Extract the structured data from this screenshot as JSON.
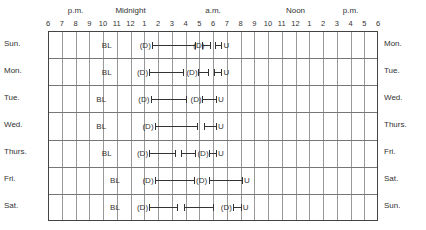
{
  "chart_data": {
    "type": "table",
    "title": "",
    "x_axis": {
      "period_labels": [
        {
          "label": "p.m.",
          "hour": 2
        },
        {
          "label": "Midnight",
          "hour": 6
        },
        {
          "label": "a.m.",
          "hour": 12
        },
        {
          "label": "Noon",
          "hour": 18
        },
        {
          "label": "p.m.",
          "hour": 22
        }
      ],
      "ticks": [
        "6",
        "7",
        "8",
        "9",
        "10",
        "11",
        "12",
        "1",
        "2",
        "3",
        "4",
        "5",
        "6",
        "7",
        "8",
        "9",
        "10",
        "11",
        "12",
        "1",
        "2",
        "3",
        "4",
        "5",
        "6"
      ],
      "range_hours_after_6pm": [
        0,
        24
      ]
    },
    "rows": [
      {
        "day_start": "Sun.",
        "day_end": "Mon.",
        "BL": 4.2,
        "D_marks": [
          7.0,
          10.9
        ],
        "sleep_segments": [
          [
            7.5,
            10.7
          ],
          [
            11.1,
            11.8
          ],
          [
            12.1,
            12.6
          ]
        ],
        "U": 12.9
      },
      {
        "day_start": "Mon.",
        "day_end": "Tue.",
        "BL": 4.2,
        "D_marks": [
          6.8,
          10.4
        ],
        "sleep_segments": [
          [
            7.3,
            9.8
          ],
          [
            10.8,
            11.6
          ],
          [
            12.0,
            12.6
          ]
        ],
        "U": 12.9
      },
      {
        "day_start": "Tue.",
        "day_end": "Wed.",
        "BL": 3.8,
        "D_marks": [
          6.9,
          10.7
        ],
        "sleep_segments": [
          [
            7.4,
            10.0
          ],
          [
            11.1,
            12.2
          ]
        ],
        "U": 12.5
      },
      {
        "day_start": "Wed.",
        "day_end": "Thurs.",
        "BL": 3.8,
        "D_marks": [
          7.2
        ],
        "sleep_segments": [
          [
            7.7,
            10.8
          ],
          [
            11.3,
            12.2
          ]
        ],
        "U": 12.5
      },
      {
        "day_start": "Thurs.",
        "day_end": "Fri.",
        "BL": 4.2,
        "D_marks": [
          6.8,
          11.2
        ],
        "sleep_segments": [
          [
            7.3,
            9.2
          ],
          [
            9.6,
            10.7
          ],
          [
            11.6,
            12.2
          ]
        ],
        "U": 12.5
      },
      {
        "day_start": "Fri.",
        "day_end": "Sat.",
        "BL": 4.8,
        "D_marks": [
          7.2,
          11.1
        ],
        "sleep_segments": [
          [
            7.7,
            10.6
          ],
          [
            11.6,
            14.1
          ]
        ],
        "U": 14.4
      },
      {
        "day_start": "Sat.",
        "day_end": "Sun.",
        "BL": 4.8,
        "D_marks": [
          6.8,
          12.9
        ],
        "sleep_segments": [
          [
            7.3,
            9.4
          ],
          [
            9.8,
            12.0
          ],
          [
            13.4,
            14.0
          ]
        ],
        "U": 14.3
      }
    ],
    "legend": {
      "BL": "BL",
      "D": "(D)",
      "U": "U"
    }
  }
}
